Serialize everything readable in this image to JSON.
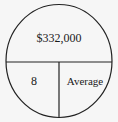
{
  "diagram": {
    "type": "magic-circle",
    "top": {
      "label": "$332,000"
    },
    "bottom_left": {
      "label": "8"
    },
    "bottom_right": {
      "label": "Average"
    },
    "stroke_color": "#222222",
    "background": "#f6f6f6"
  }
}
